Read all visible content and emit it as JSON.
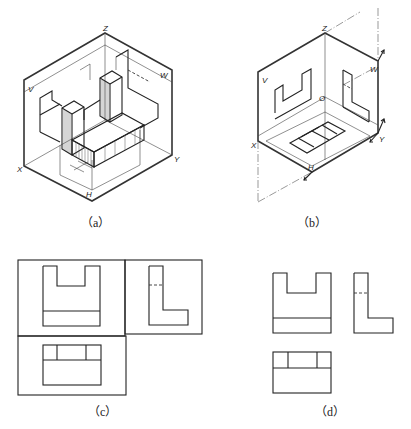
{
  "figure": {
    "top_fragment_text": "（cut-off text）",
    "panels": [
      {
        "id": "a",
        "caption": "（a）",
        "description": "Isometric view of the solid inside three projection planes",
        "axis_labels": {
          "z": "Z",
          "v": "V",
          "w": "W",
          "x": "X",
          "y": "Y",
          "h": "H"
        }
      },
      {
        "id": "b",
        "caption": "（b）",
        "description": "Projection planes unfolded with projections of the solid",
        "axis_labels": {
          "z": "Z",
          "v": "V",
          "w": "W",
          "o": "O",
          "x": "X",
          "y": "Y",
          "h": "H"
        }
      },
      {
        "id": "c",
        "caption": "（c）",
        "description": "Three views with projection plane borders"
      },
      {
        "id": "d",
        "caption": "（d）",
        "description": "Three views without borders"
      }
    ]
  }
}
